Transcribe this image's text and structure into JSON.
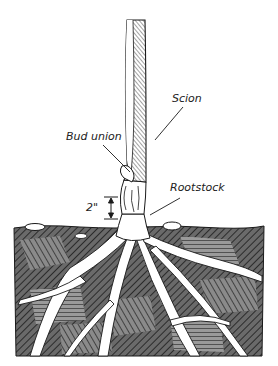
{
  "diagram": {
    "labels": {
      "scion": "Scion",
      "bud_union": "Bud union",
      "rootstock": "Rootstock",
      "measurement": "2\""
    },
    "colors": {
      "ink": "#1a1a1a",
      "soil_fill": "#5a5a5a",
      "background": "#ffffff",
      "root": "#ffffff"
    }
  }
}
